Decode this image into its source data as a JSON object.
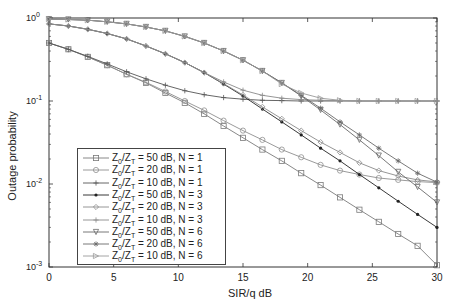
{
  "chart_data": {
    "type": "line",
    "title": "",
    "xlabel": "SIR/q dB",
    "ylabel": "Outage probability",
    "xlim": [
      0,
      30
    ],
    "ylim": [
      0.001,
      1
    ],
    "yscale": "log",
    "xticks": [
      0,
      5,
      10,
      15,
      20,
      25,
      30
    ],
    "yticks": [
      "10^0",
      "10^-1",
      "10^-2",
      "10^-3"
    ],
    "grid": false,
    "legend_position": "lower left",
    "x": [
      0,
      1.5,
      3,
      4.5,
      6,
      7.5,
      9,
      10.5,
      12,
      13.5,
      15,
      16.5,
      18,
      19.5,
      21,
      22.5,
      24,
      25.5,
      27,
      28.5,
      30
    ],
    "series": [
      {
        "name": "Z0/ZT = 50 dB, N = 1",
        "marker": "square",
        "values": [
          0.5,
          0.42,
          0.34,
          0.27,
          0.21,
          0.165,
          0.125,
          0.095,
          0.07,
          0.05,
          0.036,
          0.026,
          0.019,
          0.0135,
          0.0097,
          0.0069,
          0.0049,
          0.0035,
          0.0025,
          0.0018,
          0.00105
        ]
      },
      {
        "name": "Z0/ZT = 20 dB, N = 1",
        "marker": "circle",
        "values": [
          0.5,
          0.42,
          0.34,
          0.27,
          0.21,
          0.168,
          0.13,
          0.1,
          0.077,
          0.058,
          0.044,
          0.034,
          0.026,
          0.021,
          0.017,
          0.0145,
          0.013,
          0.0118,
          0.0112,
          0.0107,
          0.0104
        ]
      },
      {
        "name": "Z0/ZT = 10 dB, N = 1",
        "marker": "plus",
        "values": [
          0.5,
          0.42,
          0.345,
          0.28,
          0.225,
          0.185,
          0.155,
          0.133,
          0.119,
          0.11,
          0.105,
          0.102,
          0.101,
          0.1,
          0.1,
          0.1,
          0.1,
          0.1,
          0.1,
          0.1,
          0.1
        ]
      },
      {
        "name": "Z0/ZT = 50 dB, N = 3",
        "marker": "dot",
        "values": [
          0.85,
          0.8,
          0.73,
          0.65,
          0.56,
          0.46,
          0.37,
          0.29,
          0.22,
          0.16,
          0.115,
          0.08,
          0.056,
          0.039,
          0.027,
          0.019,
          0.013,
          0.009,
          0.0062,
          0.0043,
          0.003
        ]
      },
      {
        "name": "Z0/ZT = 20 dB, N = 3",
        "marker": "diamond",
        "values": [
          0.85,
          0.8,
          0.73,
          0.65,
          0.56,
          0.46,
          0.37,
          0.29,
          0.22,
          0.162,
          0.118,
          0.085,
          0.061,
          0.044,
          0.032,
          0.024,
          0.018,
          0.0145,
          0.0125,
          0.0112,
          0.0106
        ]
      },
      {
        "name": "Z0/ZT = 10 dB, N = 3",
        "marker": "plus",
        "values": [
          0.85,
          0.8,
          0.73,
          0.65,
          0.56,
          0.46,
          0.37,
          0.29,
          0.22,
          0.17,
          0.135,
          0.117,
          0.108,
          0.104,
          0.102,
          0.101,
          0.1,
          0.1,
          0.1,
          0.1,
          0.1
        ]
      },
      {
        "name": "Z0/ZT = 50 dB, N = 6",
        "marker": "triangle-down",
        "values": [
          0.97,
          0.96,
          0.94,
          0.9,
          0.85,
          0.78,
          0.7,
          0.6,
          0.5,
          0.4,
          0.31,
          0.23,
          0.165,
          0.115,
          0.078,
          0.052,
          0.034,
          0.022,
          0.014,
          0.0092,
          0.006
        ]
      },
      {
        "name": "Z0/ZT = 20 dB, N = 6",
        "marker": "star",
        "values": [
          0.97,
          0.96,
          0.94,
          0.9,
          0.85,
          0.78,
          0.7,
          0.6,
          0.5,
          0.4,
          0.31,
          0.23,
          0.165,
          0.117,
          0.082,
          0.056,
          0.039,
          0.027,
          0.019,
          0.0135,
          0.0105
        ]
      },
      {
        "name": "Z0/ZT = 10 dB, N = 6",
        "marker": "triangle-right",
        "values": [
          0.97,
          0.96,
          0.94,
          0.9,
          0.85,
          0.78,
          0.7,
          0.6,
          0.5,
          0.4,
          0.31,
          0.23,
          0.16,
          0.125,
          0.108,
          0.102,
          0.1,
          0.1,
          0.1,
          0.1,
          0.1
        ]
      }
    ]
  },
  "axes": {
    "xlabel": "SIR/q dB",
    "ylabel": "Outage probability",
    "xtick_labels": [
      "0",
      "5",
      "10",
      "15",
      "20",
      "25",
      "30"
    ],
    "ytick_labels": [
      {
        "base": "10",
        "exp": "0"
      },
      {
        "base": "10",
        "exp": "-1"
      },
      {
        "base": "10",
        "exp": "-2"
      },
      {
        "base": "10",
        "exp": "-3"
      }
    ]
  },
  "legend": {
    "items": [
      {
        "z0": "50",
        "n": "1",
        "marker": "square"
      },
      {
        "z0": "20",
        "n": "1",
        "marker": "circle"
      },
      {
        "z0": "10",
        "n": "1",
        "marker": "plus"
      },
      {
        "z0": "50",
        "n": "3",
        "marker": "dot"
      },
      {
        "z0": "20",
        "n": "3",
        "marker": "diamond"
      },
      {
        "z0": "10",
        "n": "3",
        "marker": "plus"
      },
      {
        "z0": "50",
        "n": "6",
        "marker": "triangle-down"
      },
      {
        "z0": "20",
        "n": "6",
        "marker": "star"
      },
      {
        "z0": "10",
        "n": "6",
        "marker": "triangle-right"
      }
    ]
  },
  "colors": {
    "axis": "#333333",
    "series": [
      "#7a7a7a",
      "#8f8f8f",
      "#555555",
      "#222222",
      "#8a8a8a",
      "#8a8a8a",
      "#6a6a6a",
      "#6a6a6a",
      "#9a9a9a"
    ]
  }
}
